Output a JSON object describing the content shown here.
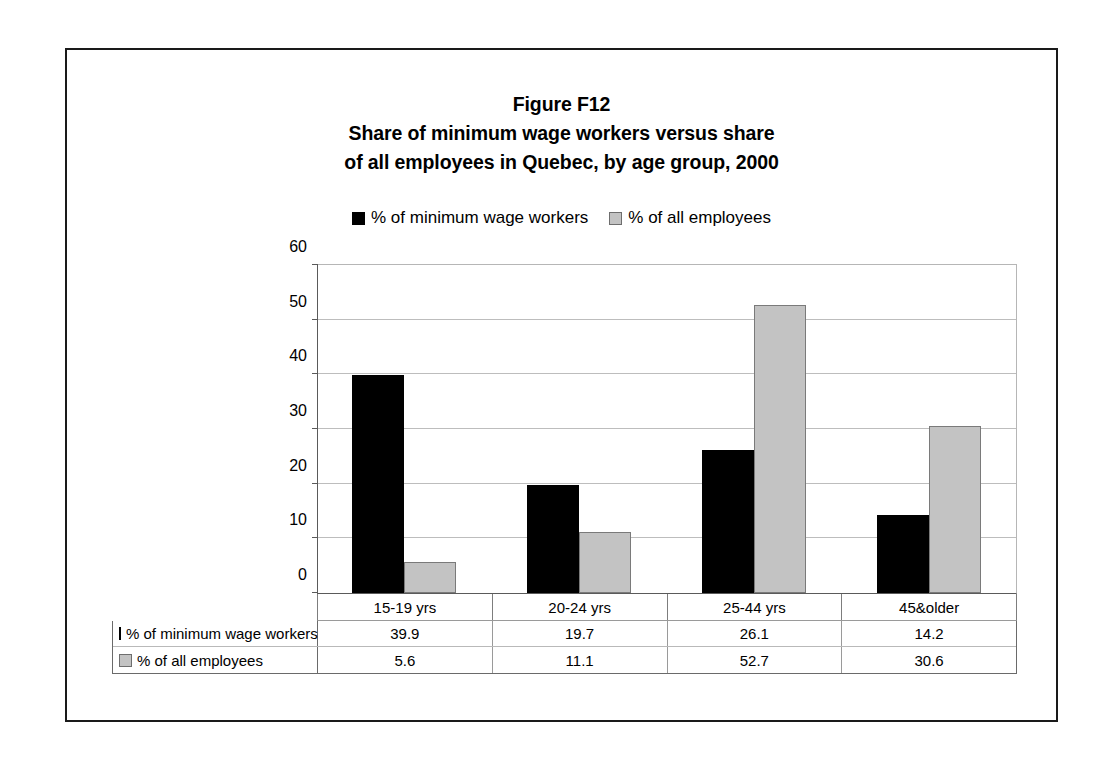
{
  "figure": {
    "label": "Figure F12",
    "title_line_1": "Share of minimum wage workers versus share",
    "title_line_2": "of all employees in Quebec, by age group, 2000"
  },
  "legend": {
    "position": "top-center",
    "entries": [
      {
        "label": "% of minimum wage workers",
        "marker": "filled-square-icon",
        "color": "#000000"
      },
      {
        "label": "% of all employees",
        "marker": "outlined-square-icon",
        "color": "#c3c3c3"
      }
    ]
  },
  "axis": {
    "y_ticks": [
      "0",
      "10",
      "20",
      "30",
      "40",
      "50",
      "60"
    ],
    "y_min": 0,
    "y_max": 60,
    "y_step": 10
  },
  "table": {
    "row_labels": [
      "% of minimum wage workers",
      "% of all employees"
    ],
    "columns": [
      "15-19 yrs",
      "20-24 yrs",
      "25-44 yrs",
      "45&older"
    ],
    "rows": [
      [
        "39.9",
        "19.7",
        "26.1",
        "14.2"
      ],
      [
        "5.6",
        "11.1",
        "52.7",
        "30.6"
      ]
    ]
  },
  "chart_data": {
    "type": "bar",
    "categories": [
      "15-19 yrs",
      "20-24 yrs",
      "25-44 yrs",
      "45&older"
    ],
    "series": [
      {
        "name": "% of minimum wage workers",
        "color": "#000000",
        "values": [
          39.9,
          19.7,
          26.1,
          14.2
        ]
      },
      {
        "name": "% of all employees",
        "color": "#c3c3c3",
        "values": [
          5.6,
          11.1,
          52.7,
          30.6
        ]
      }
    ],
    "xlabel": "",
    "ylabel": "",
    "ylim": [
      0,
      60
    ],
    "ytick_step": 10,
    "grid": "horizontal",
    "legend_position": "top-center",
    "data_table_shown": true
  }
}
